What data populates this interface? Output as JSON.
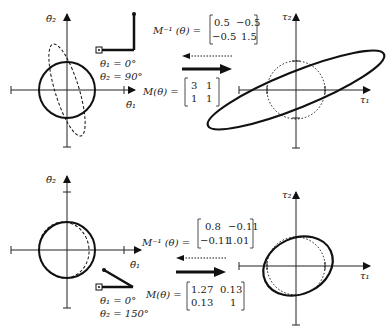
{
  "top": {
    "accel_axis_x": "θ̈₁",
    "accel_axis_y": "θ̈₂",
    "torque_axis_x": "τ₁",
    "torque_axis_y": "τ₂",
    "theta1": "θ₁ = 0°",
    "theta2": "θ₂ = 90°",
    "minv_label": "M⁻¹ (θ) =",
    "minv": [
      [
        "0.5",
        "−0.5"
      ],
      [
        "−0.5",
        "1.5"
      ]
    ],
    "m_label": "M(θ) =",
    "m": [
      [
        "3",
        "1"
      ],
      [
        "1",
        "1"
      ]
    ]
  },
  "bottom": {
    "accel_axis_x": "θ̈₁",
    "accel_axis_y": "θ̈₂",
    "torque_axis_x": "τ₁",
    "torque_axis_y": "τ₂",
    "theta1": "θ₁ = 0°",
    "theta2": "θ₂ = 150°",
    "minv_label": "M⁻¹ (θ) =",
    "minv": [
      [
        "0.8",
        "−0.11"
      ],
      [
        "−0.11",
        "1.01"
      ]
    ],
    "m_label": "M(θ) =",
    "m": [
      [
        "1.27",
        "0.13"
      ],
      [
        "0.13",
        "1"
      ]
    ]
  }
}
